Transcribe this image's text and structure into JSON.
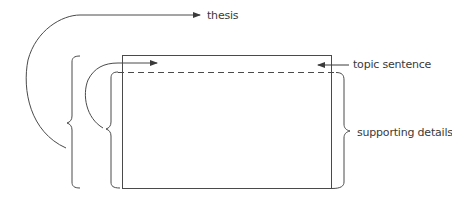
{
  "diagram": {
    "title": "",
    "labels": {
      "thesis": "thesis",
      "topic_sentence": "topic sentence",
      "supporting_details": "supporting details"
    },
    "elements": [
      {
        "id": "thesis-arrow",
        "type": "curved-arrow",
        "target_label": "thesis"
      },
      {
        "id": "outer-brace",
        "type": "left-brace"
      },
      {
        "id": "inner-brace",
        "type": "left-brace"
      },
      {
        "id": "inner-arrow",
        "type": "curved-arrow"
      },
      {
        "id": "paragraph-box",
        "type": "rectangle"
      },
      {
        "id": "topic-divider",
        "type": "dashed-line"
      },
      {
        "id": "topic-arrow",
        "type": "arrow",
        "target_label": "topic sentence"
      },
      {
        "id": "details-brace",
        "type": "right-brace",
        "target_label": "supporting details"
      }
    ],
    "colors": {
      "stroke": "#4a4a4a",
      "text": "#3a3a3a",
      "background": "#ffffff"
    }
  }
}
